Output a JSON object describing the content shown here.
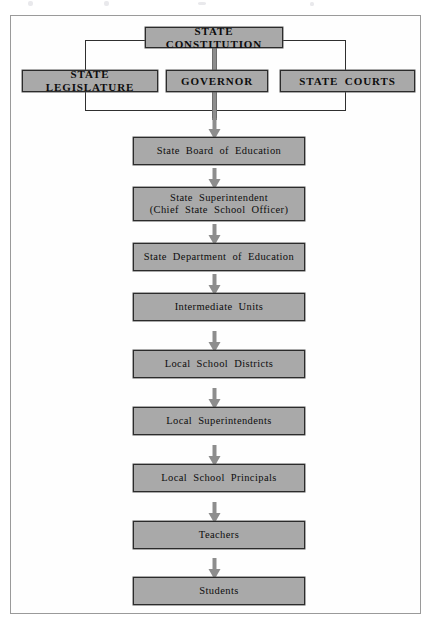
{
  "diagram": {
    "colors": {
      "box_fill": "#a9a9a9",
      "box_border": "#2b2b2b",
      "connector": "#2f2f2f",
      "arrow": "#8d8d8d",
      "frame": "#9a9a9a",
      "page": "#ffffff"
    },
    "top": {
      "label": "STATE CONSTITUTION"
    },
    "branches": [
      {
        "id": "legislature",
        "label": "STATE LEGISLATURE"
      },
      {
        "id": "governor",
        "label": "GOVERNOR"
      },
      {
        "id": "courts",
        "label": "STATE COURTS"
      }
    ],
    "chain": [
      {
        "id": "state-board-of-education",
        "lines": [
          "State Board of Education"
        ]
      },
      {
        "id": "state-superintendent",
        "lines": [
          "State Superintendent",
          "(Chief State School Officer)"
        ]
      },
      {
        "id": "state-department-of-education",
        "lines": [
          "State Department of Education"
        ]
      },
      {
        "id": "intermediate-units",
        "lines": [
          "Intermediate Units"
        ]
      },
      {
        "id": "local-school-districts",
        "lines": [
          "Local School Districts"
        ]
      },
      {
        "id": "local-superintendents",
        "lines": [
          "Local Superintendents"
        ]
      },
      {
        "id": "local-school-principals",
        "lines": [
          "Local School Principals"
        ]
      },
      {
        "id": "teachers",
        "lines": [
          "Teachers"
        ]
      },
      {
        "id": "students",
        "lines": [
          "Students"
        ]
      }
    ]
  }
}
